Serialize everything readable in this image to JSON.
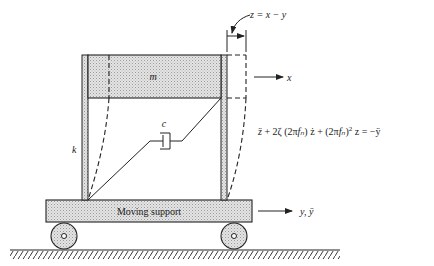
{
  "diagram": {
    "labels": {
      "mass": "m",
      "spring": "k",
      "damper": "c",
      "support": "Moving support",
      "x_axis": "x",
      "y_axis": "y, ÿ",
      "relative": "z = x − y"
    },
    "equation": {
      "text": "z̈ + 2ζ (2πfₙ) ż + (2πfₙ)² z = −ÿ",
      "parts": [
        "z̈",
        " + 2ζ (2π",
        "f",
        "ₙ",
        ") ż + (2π",
        "f",
        "ₙ",
        ")",
        "2",
        " z = −ÿ"
      ]
    },
    "colors": {
      "ink": "#222222",
      "fill_stipple": "#d9d9d9",
      "background": "#ffffff"
    }
  }
}
